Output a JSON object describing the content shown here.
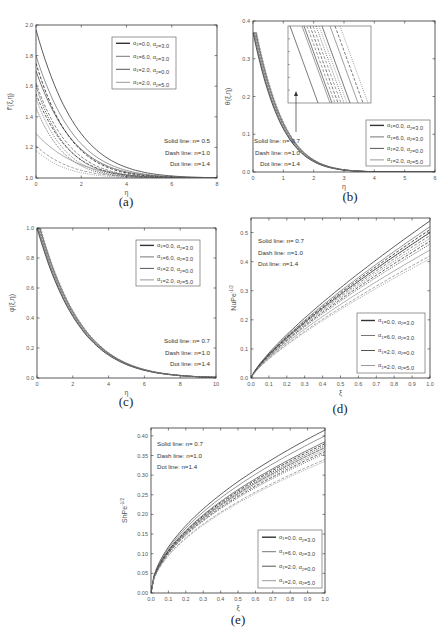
{
  "legend_entries": [
    "α1=0.0, α2=3.0",
    "α1=6.0, α2=3.0",
    "α1=2.0, α2=0.0",
    "α1=2.0, α2=5.0"
  ],
  "legend_colors": [
    "#333333",
    "#777777",
    "#555555",
    "#999999"
  ],
  "chart_data": [
    {
      "id": "a",
      "caption": "(a)",
      "type": "line",
      "xlabel": "η",
      "ylabel": "f'(ξ,η)",
      "xlim": [
        0,
        8
      ],
      "ylim": [
        1.0,
        2.0
      ],
      "xticks": [
        "0",
        "2",
        "4",
        "6",
        "8"
      ],
      "yticks": [
        "1.0",
        "1.2",
        "1.4",
        "1.6",
        "1.8",
        "2.0"
      ],
      "annotations": [
        "Solid line: n= 0.5",
        "Dash line: n=1.0",
        "Dot line: n=1.4"
      ],
      "legend": [
        "α1=0.0, α2=3.0",
        "α1=6.0, α2=3.0",
        "α1=2.0, α2=0.0",
        "α1=2.0, α2=5.0"
      ],
      "series": [
        {
          "name": "α1=6.0, α2=3.0 (n=0.5)",
          "style": "solid",
          "y0": 1.97,
          "decay": 0.55
        },
        {
          "name": "α1=2.0, α2=5.0 (n=0.5)",
          "style": "solid",
          "y0": 1.8,
          "decay": 0.58
        },
        {
          "name": "α1=2.0, α2=0.0 (n=0.5)",
          "style": "solid",
          "y0": 1.7,
          "decay": 0.6
        },
        {
          "name": "α1=0.0, α2=3.0 (n=0.5)",
          "style": "solid",
          "y0": 1.29,
          "decay": 0.55
        },
        {
          "name": "α1=6.0, α2=3.0 (n=1.0)",
          "style": "dash",
          "y0": 1.75,
          "decay": 0.65
        },
        {
          "name": "α1=2.0, α2=5.0 (n=1.0)",
          "style": "dash",
          "y0": 1.62,
          "decay": 0.68
        },
        {
          "name": "α1=2.0, α2=0.0 (n=1.0)",
          "style": "dash",
          "y0": 1.55,
          "decay": 0.7
        },
        {
          "name": "α1=0.0, α2=3.0 (n=1.0)",
          "style": "dash",
          "y0": 1.21,
          "decay": 0.65
        },
        {
          "name": "α1=6.0, α2=3.0 (n=1.4)",
          "style": "dot",
          "y0": 1.6,
          "decay": 0.75
        },
        {
          "name": "α1=2.0, α2=5.0 (n=1.4)",
          "style": "dot",
          "y0": 1.52,
          "decay": 0.78
        },
        {
          "name": "α1=2.0, α2=0.0 (n=1.4)",
          "style": "dot",
          "y0": 1.46,
          "decay": 0.8
        },
        {
          "name": "α1=0.0, α2=3.0 (n=1.4)",
          "style": "dot",
          "y0": 1.18,
          "decay": 0.75
        }
      ]
    },
    {
      "id": "b",
      "caption": "(b)",
      "type": "line",
      "xlabel": "η",
      "ylabel": "θ(ξ,η)",
      "xlim": [
        0,
        6
      ],
      "ylim": [
        0.0,
        0.4
      ],
      "xticks": [
        "0",
        "1",
        "2",
        "3",
        "4",
        "5",
        "6"
      ],
      "yticks": [
        "0.0",
        "0.1",
        "0.2",
        "0.3",
        "0.4"
      ],
      "annotations": [
        "Solid line: n= 0.7",
        "Dash line: n=1.0",
        "Dot line: n=1.4"
      ],
      "legend": [
        "α1=0.0, α2=3.0",
        "α1=6.0, α2=3.0",
        "α1=2.0, α2=0.0",
        "α1=2.0, α2=5.0"
      ],
      "inset": true,
      "series": [
        {
          "name": "all cases (overlapping)",
          "style": "solid",
          "y0": 0.37,
          "decay": 1.05
        }
      ]
    },
    {
      "id": "c",
      "caption": "(c)",
      "type": "line",
      "xlabel": "η",
      "ylabel": "φ(ξ,η)",
      "xlim": [
        0,
        10
      ],
      "ylim": [
        0.0,
        1.0
      ],
      "xticks": [
        "0",
        "2",
        "4",
        "6",
        "8",
        "10"
      ],
      "yticks": [
        "0.0",
        "0.2",
        "0.4",
        "0.6",
        "0.8",
        "1.0"
      ],
      "annotations": [
        "Solid line: n= 0.7",
        "Dash line: n=1.0",
        "Dot line: n=1.4"
      ],
      "legend": [
        "α1=0.0, α2=3.0",
        "α1=6.0, α2=3.0",
        "α1=2.0, α2=0.0",
        "α1=2.0, α2=5.0"
      ],
      "series": [
        {
          "name": "all cases (overlapping)",
          "style": "solid",
          "y0": 1.0,
          "decay": 0.42
        }
      ]
    },
    {
      "id": "d",
      "caption": "(d)",
      "type": "line",
      "xlabel": "ξ",
      "ylabel": "NuPe^-1/2",
      "xlim": [
        0.0,
        1.0
      ],
      "ylim": [
        0.0,
        0.55
      ],
      "xticks": [
        "0.0",
        "0.1",
        "0.2",
        "0.3",
        "0.4",
        "0.5",
        "0.6",
        "0.7",
        "0.8",
        "0.9",
        "1.0"
      ],
      "yticks": [
        "0.0",
        "0.1",
        "0.2",
        "0.3",
        "0.4",
        "0.5"
      ],
      "annotations": [
        "Solid line: n= 0.7",
        "Dash line: n=1.0",
        "Dot line: n=1.4"
      ],
      "legend": [
        "α1=0.0, α2=3.0",
        "α1=6.0, α2=3.0",
        "α1=2.0, α2=0.0",
        "α1=2.0, α2=5.0"
      ],
      "series": [
        {
          "name": "α1=6.0, α2=3.0 (n=0.7)",
          "style": "solid",
          "y_end": 0.54
        },
        {
          "name": "α1=2.0, α2=5.0 (n=0.7)",
          "style": "solid",
          "y_end": 0.52
        },
        {
          "name": "α1=2.0, α2=0.0 (n=0.7)",
          "style": "solid",
          "y_end": 0.5
        },
        {
          "name": "α1=0.0, α2=3.0 (n=0.7)",
          "style": "solid",
          "y_end": 0.44
        },
        {
          "name": "α1=6.0, α2=3.0 (n=1.0)",
          "style": "dash",
          "y_end": 0.51
        },
        {
          "name": "α1=2.0, α2=5.0 (n=1.0)",
          "style": "dash",
          "y_end": 0.49
        },
        {
          "name": "α1=2.0, α2=0.0 (n=1.0)",
          "style": "dash",
          "y_end": 0.47
        },
        {
          "name": "α1=0.0, α2=3.0 (n=1.0)",
          "style": "dash",
          "y_end": 0.42
        },
        {
          "name": "α1=6.0, α2=3.0 (n=1.4)",
          "style": "dot",
          "y_end": 0.5
        },
        {
          "name": "α1=2.0, α2=5.0 (n=1.4)",
          "style": "dot",
          "y_end": 0.48
        },
        {
          "name": "α1=2.0, α2=0.0 (n=1.4)",
          "style": "dot",
          "y_end": 0.46
        },
        {
          "name": "α1=0.0, α2=3.0 (n=1.4)",
          "style": "dot",
          "y_end": 0.41
        }
      ]
    },
    {
      "id": "e",
      "caption": "(e)",
      "type": "line",
      "xlabel": "ξ",
      "ylabel": "ShPe^-1/2",
      "xlim": [
        0.0,
        1.0
      ],
      "ylim": [
        0.0,
        0.42
      ],
      "xticks": [
        "0.0",
        "0.1",
        "0.2",
        "0.3",
        "0.4",
        "0.5",
        "0.6",
        "0.7",
        "0.8",
        "0.9",
        "1.0"
      ],
      "yticks": [
        "0.00",
        "0.05",
        "0.10",
        "0.15",
        "0.20",
        "0.25",
        "0.30",
        "0.35",
        "0.40"
      ],
      "annotations": [
        "Solid line: n= 0.7",
        "Dash line: n=1.0",
        "Dot line: n=1.4"
      ],
      "legend": [
        "α1=0.0, α2=3.0",
        "α1=6.0, α2=3.0",
        "α1=2.0, α2=0.0",
        "α1=2.0, α2=5.0"
      ],
      "series": [
        {
          "name": "α1=6.0, α2=3.0 (n=0.7)",
          "style": "solid",
          "y_end": 0.415
        },
        {
          "name": "α1=2.0, α2=5.0 (n=0.7)",
          "style": "solid",
          "y_end": 0.4
        },
        {
          "name": "α1=2.0, α2=0.0 (n=0.7)",
          "style": "solid",
          "y_end": 0.385
        },
        {
          "name": "α1=0.0, α2=3.0 (n=0.7)",
          "style": "solid",
          "y_end": 0.37
        },
        {
          "name": "α1=6.0, α2=3.0 (n=1.0)",
          "style": "dash",
          "y_end": 0.38
        },
        {
          "name": "α1=2.0, α2=5.0 (n=1.0)",
          "style": "dash",
          "y_end": 0.37
        },
        {
          "name": "α1=2.0, α2=0.0 (n=1.0)",
          "style": "dash",
          "y_end": 0.36
        },
        {
          "name": "α1=0.0, α2=3.0 (n=1.0)",
          "style": "dash",
          "y_end": 0.34
        },
        {
          "name": "α1=6.0, α2=3.0 (n=1.4)",
          "style": "dot",
          "y_end": 0.375
        },
        {
          "name": "α1=2.0, α2=5.0 (n=1.4)",
          "style": "dot",
          "y_end": 0.365
        },
        {
          "name": "α1=2.0, α2=0.0 (n=1.4)",
          "style": "dot",
          "y_end": 0.355
        },
        {
          "name": "α1=0.0, α2=3.0 (n=1.4)",
          "style": "dot",
          "y_end": 0.335
        }
      ]
    }
  ]
}
